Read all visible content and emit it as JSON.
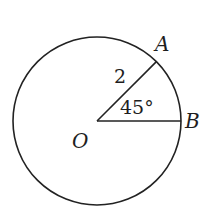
{
  "diagram": {
    "type": "circle-sector",
    "center": {
      "x": 97,
      "y": 121
    },
    "radius": 84,
    "stroke_color": "#222222",
    "labels": {
      "center": "O",
      "point_a": "A",
      "point_b": "B",
      "radius_length": "2",
      "angle": "45°"
    },
    "angle_degrees": 45,
    "radius_value": 2
  }
}
